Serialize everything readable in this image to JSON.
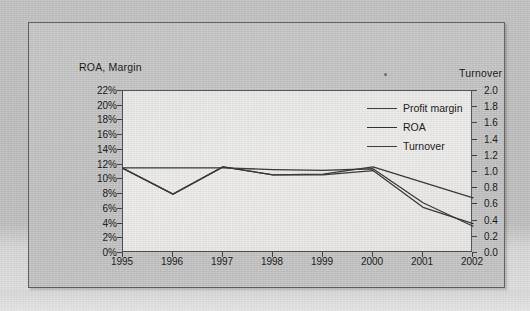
{
  "chart_data": {
    "type": "line",
    "title": "",
    "xlabel": "",
    "ylabel": "ROA, Margin",
    "y2label": "Turnover",
    "categories": [
      "1995",
      "1996",
      "1997",
      "1998",
      "1999",
      "2000",
      "2001",
      "2002"
    ],
    "ylim": [
      0,
      22
    ],
    "y2lim": [
      0.0,
      2.0
    ],
    "ytick_labels": [
      "22%",
      "20%",
      "18%",
      "16%",
      "14%",
      "12%",
      "10%",
      "8%",
      "6%",
      "4%",
      "2%",
      "0%"
    ],
    "ytick_values": [
      22,
      20,
      18,
      16,
      14,
      12,
      10,
      8,
      6,
      4,
      2,
      0
    ],
    "y2tick_labels": [
      "2.0",
      "1.8",
      "1.6",
      "1.4",
      "1.2",
      "1.0",
      "0.8",
      "0.6",
      "0.4",
      "0.2",
      "0.0"
    ],
    "y2tick_values": [
      2.0,
      1.8,
      1.6,
      1.4,
      1.2,
      1.0,
      0.8,
      0.6,
      0.4,
      0.2,
      0.0
    ],
    "grid": false,
    "legend_position": "upper-right",
    "series": [
      {
        "name": "Profit margin",
        "axis": "left",
        "unit": "percent",
        "color": "#2f2f2f",
        "values": [
          11.5,
          8.0,
          11.7,
          10.6,
          10.7,
          11.7,
          9.6,
          7.5
        ]
      },
      {
        "name": "ROA",
        "axis": "left",
        "unit": "percent",
        "color": "#2f2f2f",
        "values": [
          11.5,
          8.0,
          11.7,
          10.6,
          10.6,
          11.2,
          6.2,
          4.0
        ]
      },
      {
        "name": "Turnover",
        "axis": "right",
        "unit": "times",
        "color": "#2f2f2f",
        "values": [
          1.05,
          1.05,
          1.05,
          1.03,
          1.02,
          1.04,
          0.62,
          0.33
        ]
      }
    ]
  },
  "legend": {
    "items": [
      {
        "label": "Profit margin"
      },
      {
        "label": "ROA"
      },
      {
        "label": "Turnover"
      }
    ]
  },
  "axes": {
    "left_title": "ROA, Margin",
    "right_title": "Turnover"
  }
}
